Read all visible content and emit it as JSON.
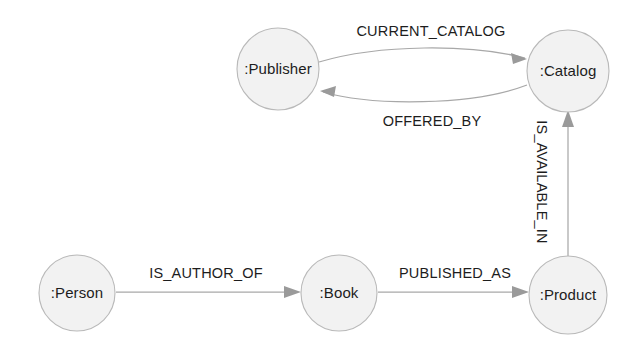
{
  "canvas": {
    "width": 639,
    "height": 354,
    "background": "#ffffff"
  },
  "style": {
    "node_fill": "#f2f2f2",
    "node_stroke": "#b9b9b9",
    "edge_color": "#a8a8a8",
    "arrow_color": "#9a9a9a",
    "text_color": "#1d1d1d"
  },
  "graph": {
    "nodes": [
      {
        "id": "publisher",
        "label": ":Publisher",
        "cx": 278,
        "cy": 69,
        "r": 41
      },
      {
        "id": "catalog",
        "label": ":Catalog",
        "cx": 568,
        "cy": 71,
        "r": 41
      },
      {
        "id": "person",
        "label": ":Person",
        "cx": 77,
        "cy": 293,
        "r": 38
      },
      {
        "id": "book",
        "label": ":Book",
        "cx": 339,
        "cy": 293,
        "r": 38
      },
      {
        "id": "product",
        "label": ":Product",
        "cx": 568,
        "cy": 295,
        "r": 39
      }
    ],
    "relationships": [
      {
        "id": "current-catalog",
        "label": "CURRENT_CATALOG",
        "from": "publisher",
        "to": "catalog",
        "shape": "curve-up",
        "label_x": 431,
        "label_y": 32,
        "rotation": 0
      },
      {
        "id": "offered-by",
        "label": "OFFERED_BY",
        "from": "catalog",
        "to": "publisher",
        "shape": "curve-down",
        "label_x": 432,
        "label_y": 122,
        "rotation": 0
      },
      {
        "id": "is-available-in",
        "label": "IS_AVAILABLE_IN",
        "from": "product",
        "to": "catalog",
        "shape": "vertical",
        "label_x": 541,
        "label_y": 182,
        "rotation": 90
      },
      {
        "id": "is-author-of",
        "label": "IS_AUTHOR_OF",
        "from": "person",
        "to": "book",
        "shape": "horizontal",
        "label_x": 206,
        "label_y": 274,
        "rotation": 0
      },
      {
        "id": "published-as",
        "label": "PUBLISHED_AS",
        "from": "book",
        "to": "product",
        "shape": "horizontal",
        "label_x": 455,
        "label_y": 274,
        "rotation": 0
      }
    ]
  }
}
